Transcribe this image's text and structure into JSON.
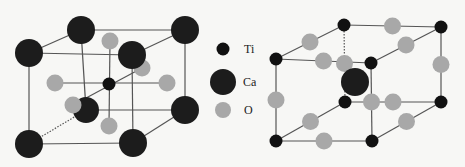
{
  "colors": {
    "background": "#f7f7f5",
    "ti": "#111111",
    "ca": "#1c1c1c",
    "o": "#a8a8a8",
    "bond": "#555555"
  },
  "legend": [
    {
      "label": "Ti",
      "species": "ti"
    },
    {
      "label": "Ca",
      "species": "ca"
    },
    {
      "label": "O",
      "species": "o"
    }
  ],
  "structures": [
    {
      "name": "ca-corner-cell",
      "corner_species": "ca",
      "body_center_species": "ti",
      "face_center_species": "o"
    },
    {
      "name": "ti-corner-cell",
      "corner_species": "ti",
      "body_center_species": "ca",
      "edge_center_species": "o"
    }
  ]
}
